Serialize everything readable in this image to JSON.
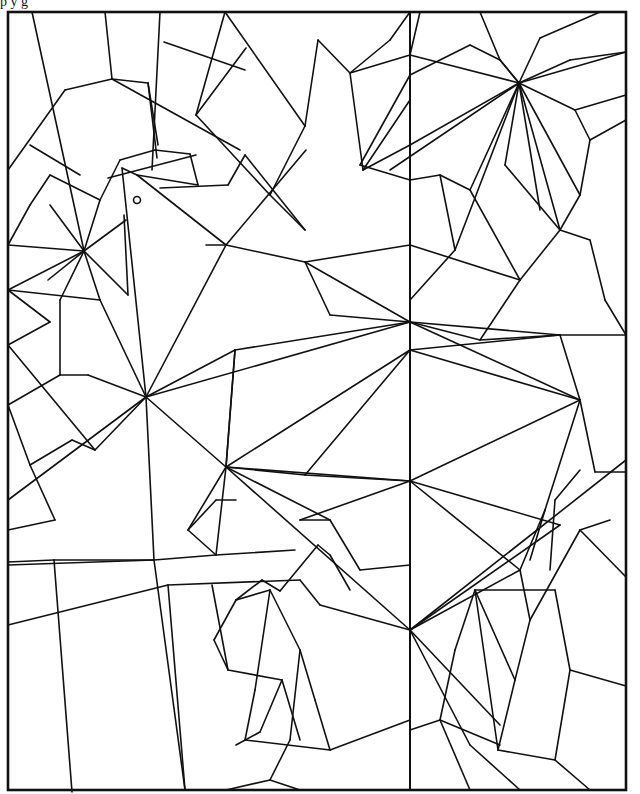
{
  "image": {
    "description": "Stained-glass style line-art coloring page of a bird made of geometric polygon segments",
    "width": 640,
    "height": 794,
    "colors": {
      "line": "#111111",
      "background": "#ffffff"
    },
    "top_caption_fragment": "p  y  g"
  },
  "frame": {
    "x": 8,
    "y": 12,
    "width": 618,
    "height": 778
  },
  "center_divider": {
    "x1": 410,
    "y1": 12,
    "x2": 410,
    "y2": 790
  },
  "eye": {
    "cx": 137,
    "cy": 200,
    "r": 3.5
  },
  "segments": [
    [
      32,
      12,
      84,
      251
    ],
    [
      105,
      12,
      112,
      79
    ],
    [
      160,
      12,
      152,
      170
    ],
    [
      225,
      12,
      196,
      115
    ],
    [
      164,
      42,
      245,
      70
    ],
    [
      246,
      48,
      196,
      115
    ],
    [
      225,
      12,
      305,
      126
    ],
    [
      305,
      126,
      270,
      195
    ],
    [
      8,
      170,
      65,
      90
    ],
    [
      30,
      145,
      80,
      175
    ],
    [
      65,
      90,
      112,
      79
    ],
    [
      112,
      79,
      148,
      83
    ],
    [
      112,
      79,
      240,
      150
    ],
    [
      148,
      83,
      157,
      158
    ],
    [
      148,
      83,
      158,
      145
    ],
    [
      84,
      251,
      8,
      245
    ],
    [
      84,
      251,
      50,
      205
    ],
    [
      84,
      251,
      100,
      200
    ],
    [
      84,
      251,
      126,
      220
    ],
    [
      84,
      251,
      128,
      295
    ],
    [
      84,
      251,
      48,
      280
    ],
    [
      84,
      251,
      60,
      300
    ],
    [
      84,
      251,
      8,
      290
    ],
    [
      84,
      251,
      100,
      300
    ],
    [
      8,
      245,
      30,
      205
    ],
    [
      30,
      205,
      50,
      175
    ],
    [
      50,
      175,
      100,
      200
    ],
    [
      100,
      200,
      120,
      160
    ],
    [
      108,
      178,
      196,
      155
    ],
    [
      120,
      160,
      155,
      150
    ],
    [
      155,
      150,
      190,
      154
    ],
    [
      190,
      154,
      198,
      185
    ],
    [
      160,
      188,
      228,
      185
    ],
    [
      228,
      185,
      245,
      155
    ],
    [
      137,
      175,
      198,
      185
    ],
    [
      122,
      168,
      137,
      175
    ],
    [
      137,
      175,
      226,
      245
    ],
    [
      226,
      245,
      306,
      150
    ],
    [
      206,
      245,
      226,
      245
    ],
    [
      226,
      245,
      305,
      262
    ],
    [
      226,
      245,
      146,
      397
    ],
    [
      122,
      168,
      146,
      397
    ],
    [
      124,
      215,
      128,
      295
    ],
    [
      196,
      115,
      270,
      195
    ],
    [
      270,
      195,
      305,
      230
    ],
    [
      245,
      155,
      305,
      230
    ],
    [
      305,
      126,
      318,
      40
    ],
    [
      318,
      40,
      350,
      73
    ],
    [
      350,
      73,
      390,
      40
    ],
    [
      390,
      40,
      410,
      12
    ],
    [
      350,
      73,
      410,
      55
    ],
    [
      410,
      55,
      519,
      83
    ],
    [
      410,
      55,
      420,
      12
    ],
    [
      350,
      73,
      363,
      170
    ],
    [
      363,
      170,
      410,
      100
    ],
    [
      363,
      170,
      410,
      145
    ],
    [
      410,
      75,
      470,
      45
    ],
    [
      470,
      45,
      500,
      60
    ],
    [
      500,
      60,
      519,
      83
    ],
    [
      480,
      12,
      500,
      60
    ],
    [
      500,
      60,
      519,
      83
    ],
    [
      519,
      83,
      540,
      38
    ],
    [
      540,
      38,
      600,
      12
    ],
    [
      519,
      83,
      570,
      60
    ],
    [
      570,
      60,
      626,
      52
    ],
    [
      519,
      83,
      626,
      52
    ],
    [
      519,
      83,
      575,
      110
    ],
    [
      575,
      110,
      626,
      95
    ],
    [
      519,
      83,
      455,
      250
    ],
    [
      519,
      83,
      390,
      170
    ],
    [
      519,
      83,
      410,
      145
    ],
    [
      519,
      83,
      470,
      190
    ],
    [
      519,
      83,
      505,
      165
    ],
    [
      519,
      83,
      560,
      230
    ],
    [
      519,
      83,
      580,
      195
    ],
    [
      519,
      83,
      540,
      210
    ],
    [
      410,
      75,
      360,
      165
    ],
    [
      360,
      165,
      410,
      180
    ],
    [
      410,
      180,
      440,
      175
    ],
    [
      440,
      175,
      470,
      190
    ],
    [
      440,
      175,
      455,
      250
    ],
    [
      455,
      250,
      410,
      300
    ],
    [
      505,
      165,
      560,
      230
    ],
    [
      560,
      230,
      580,
      195
    ],
    [
      580,
      195,
      590,
      140
    ],
    [
      590,
      140,
      626,
      120
    ],
    [
      575,
      110,
      590,
      140
    ],
    [
      560,
      230,
      590,
      240
    ],
    [
      590,
      240,
      605,
      300
    ],
    [
      605,
      300,
      626,
      335
    ],
    [
      470,
      190,
      520,
      280
    ],
    [
      520,
      280,
      560,
      230
    ],
    [
      520,
      280,
      480,
      340
    ],
    [
      480,
      340,
      410,
      322
    ],
    [
      480,
      340,
      560,
      335
    ],
    [
      8,
      290,
      100,
      300
    ],
    [
      100,
      300,
      146,
      397
    ],
    [
      8,
      290,
      50,
      322
    ],
    [
      50,
      322,
      8,
      345
    ],
    [
      60,
      300,
      60,
      375
    ],
    [
      60,
      375,
      8,
      405
    ],
    [
      60,
      375,
      88,
      375
    ],
    [
      88,
      375,
      146,
      397
    ],
    [
      8,
      345,
      95,
      450
    ],
    [
      95,
      450,
      146,
      397
    ],
    [
      8,
      405,
      30,
      465
    ],
    [
      30,
      465,
      72,
      440
    ],
    [
      72,
      440,
      95,
      450
    ],
    [
      30,
      465,
      55,
      520
    ],
    [
      55,
      520,
      8,
      530
    ],
    [
      146,
      397,
      410,
      322
    ],
    [
      146,
      397,
      8,
      500
    ],
    [
      146,
      397,
      226,
      467
    ],
    [
      146,
      397,
      235,
      350
    ],
    [
      146,
      397,
      154,
      560
    ],
    [
      235,
      350,
      410,
      322
    ],
    [
      235,
      350,
      226,
      467
    ],
    [
      305,
      262,
      410,
      322
    ],
    [
      305,
      262,
      410,
      245
    ],
    [
      305,
      262,
      330,
      315
    ],
    [
      410,
      245,
      520,
      280
    ],
    [
      330,
      315,
      410,
      322
    ],
    [
      410,
      322,
      560,
      335
    ],
    [
      410,
      322,
      580,
      400
    ],
    [
      410,
      322,
      410,
      350
    ],
    [
      410,
      350,
      560,
      335
    ],
    [
      410,
      350,
      580,
      400
    ],
    [
      410,
      350,
      226,
      467
    ],
    [
      410,
      350,
      305,
      475
    ],
    [
      226,
      467,
      410,
      481
    ],
    [
      226,
      467,
      235,
      350
    ],
    [
      226,
      467,
      305,
      475
    ],
    [
      226,
      467,
      188,
      530
    ],
    [
      226,
      467,
      216,
      555
    ],
    [
      226,
      467,
      330,
      520
    ],
    [
      226,
      467,
      410,
      630
    ],
    [
      560,
      335,
      580,
      400
    ],
    [
      560,
      335,
      626,
      335
    ],
    [
      580,
      400,
      595,
      472
    ],
    [
      595,
      472,
      626,
      472
    ],
    [
      580,
      400,
      410,
      481
    ],
    [
      580,
      400,
      545,
      510
    ],
    [
      545,
      510,
      530,
      560
    ],
    [
      410,
      481,
      560,
      525
    ],
    [
      410,
      481,
      520,
      570
    ],
    [
      410,
      481,
      300,
      520
    ],
    [
      410,
      481,
      305,
      475
    ],
    [
      300,
      520,
      330,
      520
    ],
    [
      330,
      520,
      360,
      570
    ],
    [
      360,
      570,
      410,
      565
    ],
    [
      154,
      560,
      8,
      565
    ],
    [
      154,
      560,
      216,
      555
    ],
    [
      216,
      555,
      295,
      550
    ],
    [
      216,
      555,
      188,
      530
    ],
    [
      188,
      530,
      216,
      500
    ],
    [
      216,
      500,
      236,
      500
    ],
    [
      8,
      562,
      54,
      560
    ],
    [
      54,
      560,
      72,
      792
    ],
    [
      54,
      560,
      154,
      560
    ],
    [
      154,
      560,
      185,
      790
    ],
    [
      168,
      585,
      300,
      580
    ],
    [
      300,
      580,
      320,
      605
    ],
    [
      320,
      605,
      410,
      630
    ],
    [
      8,
      625,
      168,
      585
    ],
    [
      168,
      585,
      185,
      790
    ],
    [
      212,
      585,
      228,
      670
    ],
    [
      228,
      670,
      282,
      680
    ],
    [
      282,
      680,
      300,
      740
    ],
    [
      282,
      680,
      260,
      732
    ],
    [
      260,
      732,
      236,
      745
    ],
    [
      236,
      600,
      214,
      640
    ],
    [
      214,
      640,
      228,
      670
    ],
    [
      236,
      600,
      262,
      580
    ],
    [
      262,
      580,
      280,
      591
    ],
    [
      280,
      591,
      318,
      545
    ],
    [
      318,
      545,
      330,
      555
    ],
    [
      330,
      555,
      350,
      590
    ],
    [
      236,
      600,
      270,
      590
    ],
    [
      270,
      590,
      300,
      650
    ],
    [
      300,
      650,
      315,
      700
    ],
    [
      315,
      700,
      330,
      750
    ],
    [
      330,
      750,
      410,
      720
    ],
    [
      245,
      740,
      330,
      750
    ],
    [
      270,
      590,
      255,
      690
    ],
    [
      255,
      690,
      245,
      740
    ],
    [
      300,
      650,
      290,
      740
    ],
    [
      290,
      740,
      270,
      780
    ],
    [
      270,
      780,
      300,
      790
    ],
    [
      270,
      780,
      226,
      790
    ],
    [
      410,
      630,
      560,
      525
    ],
    [
      410,
      630,
      520,
      570
    ],
    [
      410,
      630,
      626,
      460
    ],
    [
      410,
      630,
      500,
      725
    ],
    [
      410,
      630,
      470,
      745
    ],
    [
      410,
      630,
      410,
      720
    ],
    [
      520,
      570,
      545,
      510
    ],
    [
      520,
      570,
      530,
      620
    ],
    [
      530,
      620,
      580,
      530
    ],
    [
      580,
      530,
      626,
      577
    ],
    [
      580,
      530,
      610,
      520
    ],
    [
      475,
      590,
      555,
      590
    ],
    [
      555,
      590,
      570,
      670
    ],
    [
      570,
      670,
      626,
      686
    ],
    [
      570,
      670,
      555,
      760
    ],
    [
      555,
      760,
      590,
      790
    ],
    [
      555,
      760,
      498,
      750
    ],
    [
      498,
      750,
      475,
      590
    ],
    [
      498,
      750,
      515,
      680
    ],
    [
      515,
      680,
      530,
      620
    ],
    [
      515,
      680,
      475,
      590
    ],
    [
      475,
      590,
      455,
      650
    ],
    [
      455,
      650,
      440,
      720
    ],
    [
      440,
      720,
      500,
      745
    ],
    [
      440,
      720,
      470,
      790
    ],
    [
      440,
      720,
      410,
      730
    ],
    [
      470,
      745,
      520,
      790
    ],
    [
      550,
      570,
      555,
      500
    ],
    [
      555,
      500,
      580,
      470
    ]
  ],
  "interactive": []
}
